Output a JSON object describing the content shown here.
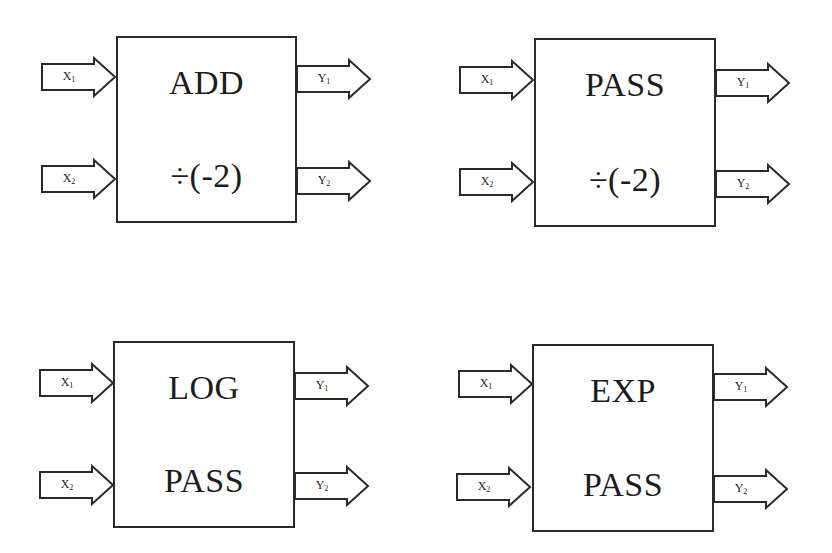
{
  "diagram": {
    "title": "",
    "colors": {
      "stroke": "#2a2a2a",
      "text": "#1c1c1c",
      "background": "#fefefe"
    },
    "blocks": [
      {
        "id": "block-1",
        "top_op": "ADD",
        "bottom_op": "÷(-2)",
        "inputs": [
          {
            "var": "X",
            "sub": "1"
          },
          {
            "var": "X",
            "sub": "2"
          }
        ],
        "outputs": [
          {
            "var": "Y",
            "sub": "1"
          },
          {
            "var": "Y",
            "sub": "2"
          }
        ]
      },
      {
        "id": "block-2",
        "top_op": "PASS",
        "bottom_op": "÷(-2)",
        "inputs": [
          {
            "var": "X",
            "sub": "1"
          },
          {
            "var": "X",
            "sub": "2"
          }
        ],
        "outputs": [
          {
            "var": "Y",
            "sub": "1"
          },
          {
            "var": "Y",
            "sub": "2"
          }
        ]
      },
      {
        "id": "block-3",
        "top_op": "LOG",
        "bottom_op": "PASS",
        "inputs": [
          {
            "var": "X",
            "sub": "1"
          },
          {
            "var": "X",
            "sub": "2"
          }
        ],
        "outputs": [
          {
            "var": "Y",
            "sub": "1"
          },
          {
            "var": "Y",
            "sub": "2"
          }
        ]
      },
      {
        "id": "block-4",
        "top_op": "EXP",
        "bottom_op": "PASS",
        "inputs": [
          {
            "var": "X",
            "sub": "1"
          },
          {
            "var": "X",
            "sub": "2"
          }
        ],
        "outputs": [
          {
            "var": "Y",
            "sub": "1"
          },
          {
            "var": "Y",
            "sub": "2"
          }
        ]
      }
    ]
  }
}
